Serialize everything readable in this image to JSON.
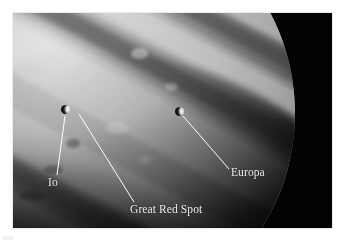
{
  "figure": {
    "kind": "annotated-astronomical-photograph",
    "color_mode": "grayscale",
    "plate": {
      "x": 13,
      "y": 13,
      "width": 319,
      "height": 215,
      "background_color": "#030303",
      "mount_color": "#ffffff"
    }
  },
  "planet": {
    "name": "Jupiter",
    "visible_portion": "lower-right limb, upper-left quadrant of frame",
    "features": [
      "cloud belts",
      "zones",
      "terminator",
      "white ovals"
    ]
  },
  "annotations": [
    {
      "id": "io",
      "label": "Io",
      "kind": "moon",
      "marker": {
        "x": 66,
        "y": 110,
        "diameter": 9
      },
      "leader": {
        "x1": 65,
        "y1": 116,
        "x2": 57,
        "y2": 175
      },
      "label_pos": {
        "x": 48,
        "y": 177
      }
    },
    {
      "id": "great-red-spot",
      "label": "Great Red Spot",
      "kind": "storm",
      "marker": null,
      "leader": {
        "x1": 79,
        "y1": 114,
        "x2": 134,
        "y2": 202
      },
      "label_pos": {
        "x": 130,
        "y": 204
      }
    },
    {
      "id": "europa",
      "label": "Europa",
      "kind": "moon",
      "marker": {
        "x": 180,
        "y": 112,
        "diameter": 9
      },
      "leader": {
        "x1": 183,
        "y1": 116,
        "x2": 229,
        "y2": 169
      },
      "label_pos": {
        "x": 231,
        "y": 167
      }
    }
  ],
  "style": {
    "label_color": "#f4f4f4",
    "leader_color": "#ffffff",
    "label_font_size_px": 11.5,
    "background_space_color": "#030303"
  }
}
